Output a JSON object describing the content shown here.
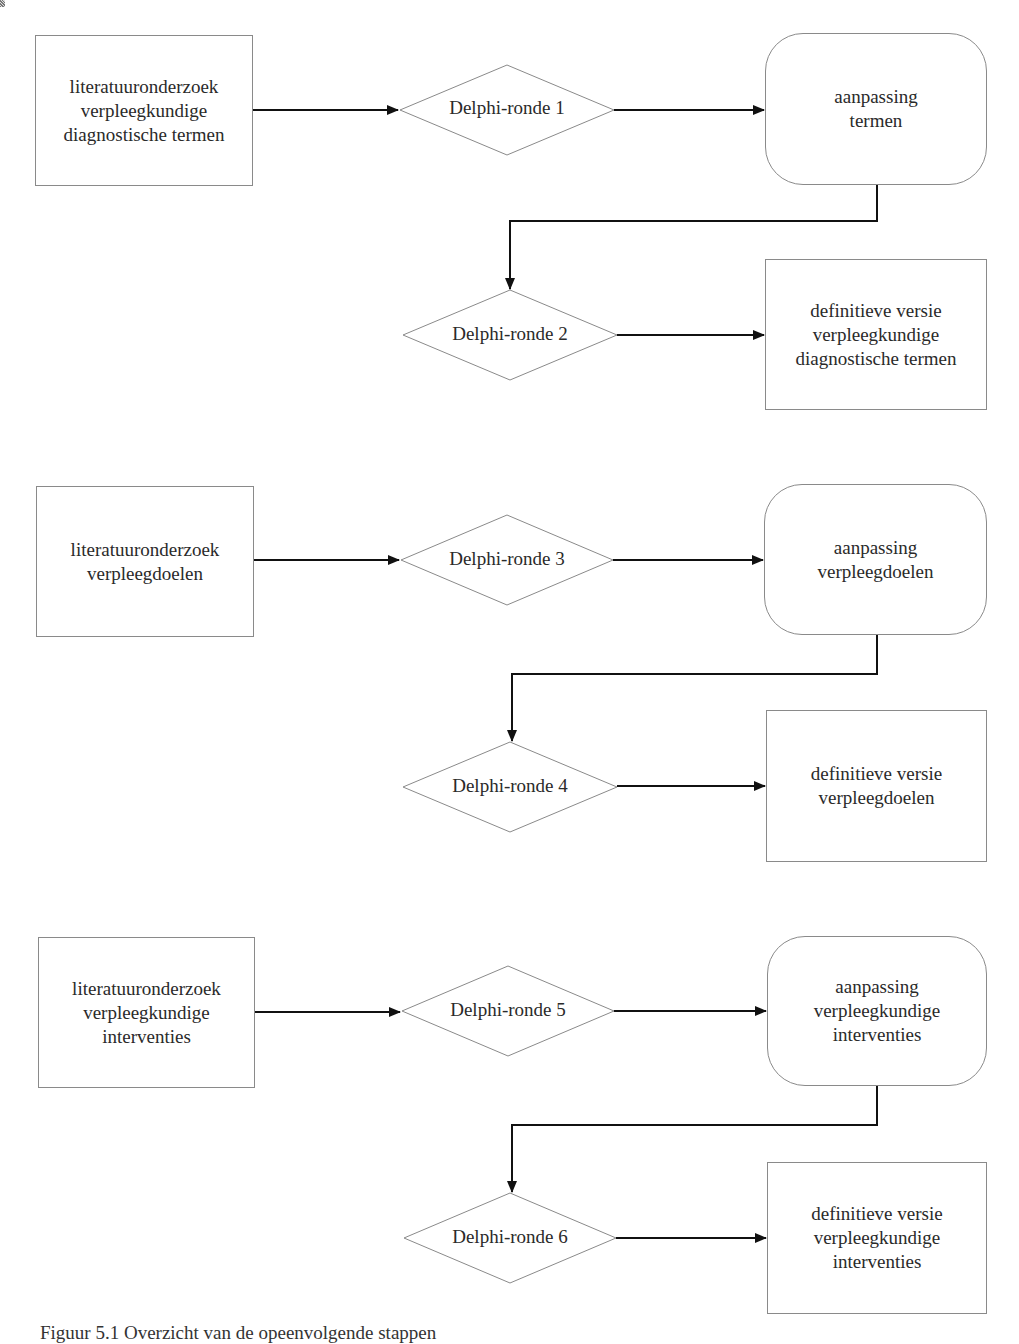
{
  "diagram": {
    "type": "flowchart",
    "colors": {
      "shape_stroke": "#8a8a8a",
      "arrow": "#111111",
      "text": "#2a2a2a",
      "background": "#ffffff"
    },
    "groups": [
      {
        "id": "diagnoses",
        "source": {
          "lines": [
            "literatuuronderzoek",
            "verpleegkundige",
            "diagnostische termen"
          ]
        },
        "round_a": {
          "label": "Delphi-ronde 1"
        },
        "adjust": {
          "lines": [
            "aanpassing",
            "termen"
          ]
        },
        "round_b": {
          "label": "Delphi-ronde 2"
        },
        "final": {
          "lines": [
            "definitieve versie",
            "verpleegkundige",
            "diagnostische termen"
          ]
        }
      },
      {
        "id": "goals",
        "source": {
          "lines": [
            "literatuuronderzoek",
            "verpleegdoelen"
          ]
        },
        "round_a": {
          "label": "Delphi-ronde 3"
        },
        "adjust": {
          "lines": [
            "aanpassing",
            "verpleegdoelen"
          ]
        },
        "round_b": {
          "label": "Delphi-ronde 4"
        },
        "final": {
          "lines": [
            "definitieve versie",
            "verpleegdoelen"
          ]
        }
      },
      {
        "id": "interventions",
        "source": {
          "lines": [
            "literatuuronderzoek",
            "verpleegkundige",
            "interventies"
          ]
        },
        "round_a": {
          "label": "Delphi-ronde 5"
        },
        "adjust": {
          "lines": [
            "aanpassing",
            "verpleegkundige",
            "interventies"
          ]
        },
        "round_b": {
          "label": "Delphi-ronde 6"
        },
        "final": {
          "lines": [
            "definitieve versie",
            "verpleegkundige",
            "interventies"
          ]
        }
      }
    ],
    "edges": [
      [
        "source",
        "round_a"
      ],
      [
        "round_a",
        "adjust"
      ],
      [
        "adjust",
        "round_b"
      ],
      [
        "round_b",
        "final"
      ]
    ]
  },
  "caption": {
    "text": "Figuur 5.1 Overzicht van de opeenvolgende stappen"
  }
}
